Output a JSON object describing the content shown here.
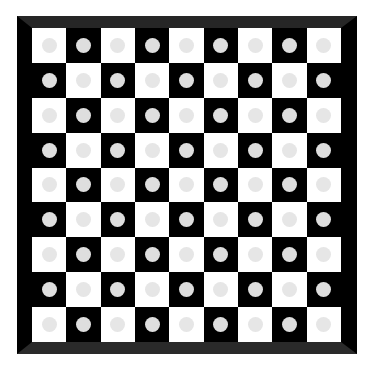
{
  "board": {
    "rows": 9,
    "cols": 9,
    "colors": {
      "light_square": "#ffffff",
      "dark_square": "#000000",
      "frame": "#000000",
      "frame_bevel": "#262626",
      "piece_on_light": "#e6e6e6",
      "piece_on_dark": "#dedede"
    },
    "pattern": "checkerboard, top-left light; every square holds one light-gray circle",
    "cells": [
      [
        "light",
        "dark",
        "light",
        "dark",
        "light",
        "dark",
        "light",
        "dark",
        "light"
      ],
      [
        "dark",
        "light",
        "dark",
        "light",
        "dark",
        "light",
        "dark",
        "light",
        "dark"
      ],
      [
        "light",
        "dark",
        "light",
        "dark",
        "light",
        "dark",
        "light",
        "dark",
        "light"
      ],
      [
        "dark",
        "light",
        "dark",
        "light",
        "dark",
        "light",
        "dark",
        "light",
        "dark"
      ],
      [
        "light",
        "dark",
        "light",
        "dark",
        "light",
        "dark",
        "light",
        "dark",
        "light"
      ],
      [
        "dark",
        "light",
        "dark",
        "light",
        "dark",
        "light",
        "dark",
        "light",
        "dark"
      ],
      [
        "light",
        "dark",
        "light",
        "dark",
        "light",
        "dark",
        "light",
        "dark",
        "light"
      ],
      [
        "dark",
        "light",
        "dark",
        "light",
        "dark",
        "light",
        "dark",
        "light",
        "dark"
      ],
      [
        "light",
        "dark",
        "light",
        "dark",
        "light",
        "dark",
        "light",
        "dark",
        "light"
      ]
    ],
    "pieces": "circle-on-every-square"
  }
}
